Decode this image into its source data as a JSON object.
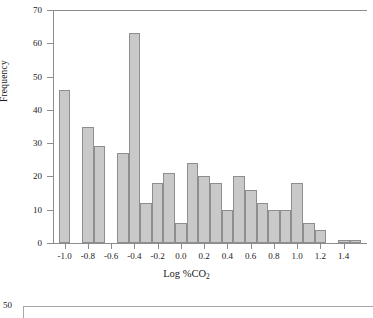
{
  "chart_data": {
    "type": "bar",
    "title": "",
    "subtitle": "",
    "xlabel": "Log %CO2",
    "xlabel_base": "Log %CO",
    "xlabel_sub": "2",
    "ylabel": "Frequency",
    "xlim": [
      -1.1,
      1.6
    ],
    "ylim": [
      0,
      70
    ],
    "xticks": [
      "-1.0",
      "-0.8",
      "-0.6",
      "-0.4",
      "-0.2",
      "0.0",
      "0.2",
      "0.4",
      "0.6",
      "0.8",
      "1.0",
      "1.2",
      "1.4"
    ],
    "xtick_values": [
      -1.0,
      -0.8,
      -0.6,
      -0.4,
      -0.2,
      0.0,
      0.2,
      0.4,
      0.6,
      0.8,
      1.0,
      1.2,
      1.4
    ],
    "yticks": [
      "0",
      "10",
      "20",
      "30",
      "40",
      "50",
      "60",
      "70"
    ],
    "ytick_values": [
      0,
      10,
      20,
      30,
      40,
      50,
      60,
      70
    ],
    "grid": false,
    "legend": null,
    "bin_width": 0.1,
    "bar_color": "#c9c9c9",
    "bar_edge_color": "#8e8e8e",
    "bins": [
      {
        "left": -1.05,
        "right": -0.95,
        "value": 46
      },
      {
        "left": -0.85,
        "right": -0.75,
        "value": 35
      },
      {
        "left": -0.75,
        "right": -0.65,
        "value": 29
      },
      {
        "left": -0.55,
        "right": -0.45,
        "value": 27
      },
      {
        "left": -0.45,
        "right": -0.35,
        "value": 63
      },
      {
        "left": -0.35,
        "right": -0.25,
        "value": 12
      },
      {
        "left": -0.25,
        "right": -0.15,
        "value": 18
      },
      {
        "left": -0.15,
        "right": -0.05,
        "value": 21
      },
      {
        "left": -0.05,
        "right": 0.05,
        "value": 6
      },
      {
        "left": 0.05,
        "right": 0.15,
        "value": 24
      },
      {
        "left": 0.15,
        "right": 0.25,
        "value": 20
      },
      {
        "left": 0.25,
        "right": 0.35,
        "value": 18
      },
      {
        "left": 0.35,
        "right": 0.45,
        "value": 10
      },
      {
        "left": 0.45,
        "right": 0.55,
        "value": 20
      },
      {
        "left": 0.55,
        "right": 0.65,
        "value": 16
      },
      {
        "left": 0.65,
        "right": 0.75,
        "value": 12
      },
      {
        "left": 0.75,
        "right": 0.85,
        "value": 10
      },
      {
        "left": 0.85,
        "right": 0.95,
        "value": 10
      },
      {
        "left": 0.95,
        "right": 1.05,
        "value": 18
      },
      {
        "left": 1.05,
        "right": 1.15,
        "value": 6
      },
      {
        "left": 1.15,
        "right": 1.25,
        "value": 4
      },
      {
        "left": 1.35,
        "right": 1.45,
        "value": 1
      },
      {
        "left": 1.45,
        "right": 1.55,
        "value": 1
      }
    ],
    "categories": [
      "-1.0",
      "-0.8",
      "-0.7",
      "-0.5",
      "-0.4",
      "-0.3",
      "-0.2",
      "-0.1",
      "0.0",
      "0.1",
      "0.2",
      "0.3",
      "0.4",
      "0.5",
      "0.6",
      "0.7",
      "0.8",
      "0.9",
      "1.0",
      "1.1",
      "1.2",
      "1.4",
      "1.5"
    ],
    "values": [
      46,
      35,
      29,
      27,
      63,
      12,
      18,
      21,
      6,
      24,
      20,
      18,
      10,
      20,
      16,
      12,
      10,
      10,
      18,
      6,
      4,
      1,
      1
    ]
  },
  "next_figure": {
    "ytick_label": "50"
  }
}
